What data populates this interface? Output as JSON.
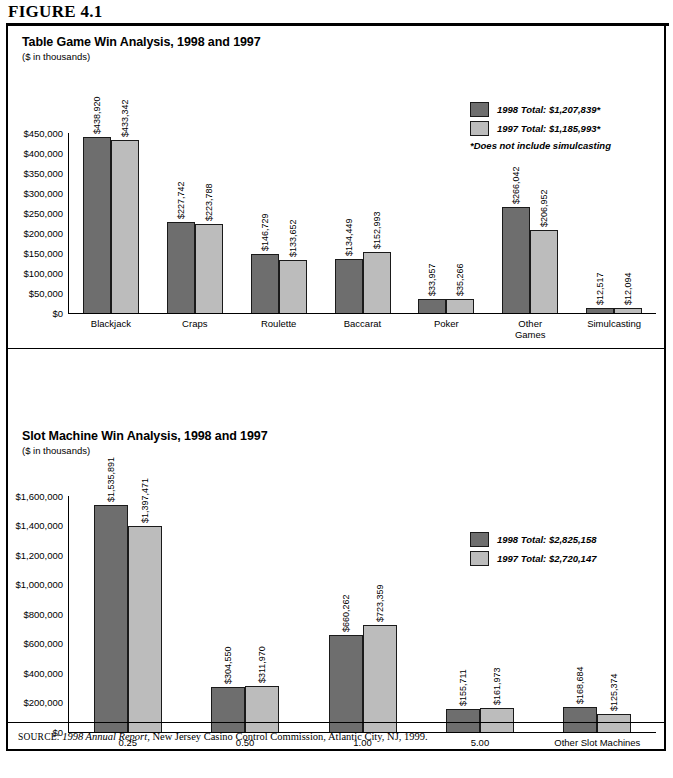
{
  "figure": {
    "heading": "FIGURE 4.1",
    "source_label": "SOURCE:",
    "source_italic": "1998 Annual Report",
    "source_rest": ", New Jersey Casino Control Commission, Atlantic City, NJ, 1999."
  },
  "panel1": {
    "title": "Table Game Win Analysis, 1998 and 1997",
    "subtitle": "($ in thousands)",
    "legend": {
      "item_1998": "1998 Total: $1,207,839*",
      "item_1997": "1997 Total: $1,185,993*",
      "note": "*Does not include simulcasting"
    }
  },
  "panel2": {
    "title": "Slot Machine Win Analysis, 1998 and 1997",
    "subtitle": "($ in thousands)",
    "legend": {
      "item_1998": "1998 Total: $2,825,158",
      "item_1997": "1997 Total: $2,720,147",
      "note": ""
    }
  },
  "colors": {
    "series_1998": "#6e6e6e",
    "series_1997": "#bcbcbc",
    "axis": "#000000"
  },
  "chart_data": [
    {
      "type": "bar",
      "title": "Table Game Win Analysis, 1998 and 1997",
      "subtitle": "($ in thousands)",
      "xlabel": "",
      "ylabel": "",
      "ylim": [
        0,
        450000
      ],
      "ytick_step": 50000,
      "yticks": [
        "$0",
        "$50,000",
        "$100,000",
        "$150,000",
        "$200,000",
        "$250,000",
        "$300,000",
        "$350,000",
        "$400,000",
        "$450,000"
      ],
      "ytick_values": [
        0,
        50000,
        100000,
        150000,
        200000,
        250000,
        300000,
        350000,
        400000,
        450000
      ],
      "grid": false,
      "legend_position": "top-right",
      "categories": [
        "Blackjack",
        "Craps",
        "Roulette",
        "Baccarat",
        "Poker",
        "Other\nGames",
        "Simulcasting"
      ],
      "series": [
        {
          "name": "1998",
          "color": "#6e6e6e",
          "values": [
            438920,
            227742,
            146729,
            134449,
            33957,
            266042,
            12517
          ],
          "labels": [
            "$438,920",
            "$227,742",
            "$146,729",
            "$134,449",
            "$33,957",
            "$266,042",
            "$12,517"
          ],
          "total_label": "1998 Total: $1,207,839*"
        },
        {
          "name": "1997",
          "color": "#bcbcbc",
          "values": [
            433342,
            223788,
            133652,
            152993,
            35266,
            206952,
            12094
          ],
          "labels": [
            "$433,342",
            "$223,788",
            "$133,652",
            "$152,993",
            "$35,266",
            "$206,952",
            "$12,094"
          ],
          "total_label": "1997 Total: $1,185,993*"
        }
      ],
      "annotations": [
        "*Does not include simulcasting"
      ]
    },
    {
      "type": "bar",
      "title": "Slot Machine Win Analysis, 1998 and 1997",
      "subtitle": "($ in thousands)",
      "xlabel": "",
      "ylabel": "",
      "ylim": [
        0,
        1600000
      ],
      "ytick_step": 200000,
      "yticks": [
        "$0",
        "$200,000",
        "$400,000",
        "$600,000",
        "$800,000",
        "$1,000,000",
        "$1,200,000",
        "$1,400,000",
        "$1,600,000"
      ],
      "ytick_values": [
        0,
        200000,
        400000,
        600000,
        800000,
        1000000,
        1200000,
        1400000,
        1600000
      ],
      "grid": false,
      "legend_position": "top-right",
      "categories": [
        "0.25",
        "0.50",
        "1.00",
        "5.00",
        "Other Slot Machines"
      ],
      "series": [
        {
          "name": "1998",
          "color": "#6e6e6e",
          "values": [
            1535891,
            304550,
            660262,
            155711,
            168684
          ],
          "labels": [
            "$1,535,891",
            "$304,550",
            "$660,262",
            "$155,711",
            "$168,684"
          ],
          "total_label": "1998 Total: $2,825,158"
        },
        {
          "name": "1997",
          "color": "#bcbcbc",
          "values": [
            1397471,
            311970,
            723359,
            161973,
            125374
          ],
          "labels": [
            "$1,397,471",
            "$311,970",
            "$723,359",
            "$161,973",
            "$125,374"
          ],
          "total_label": "1997 Total: $2,720,147"
        }
      ],
      "annotations": []
    }
  ]
}
